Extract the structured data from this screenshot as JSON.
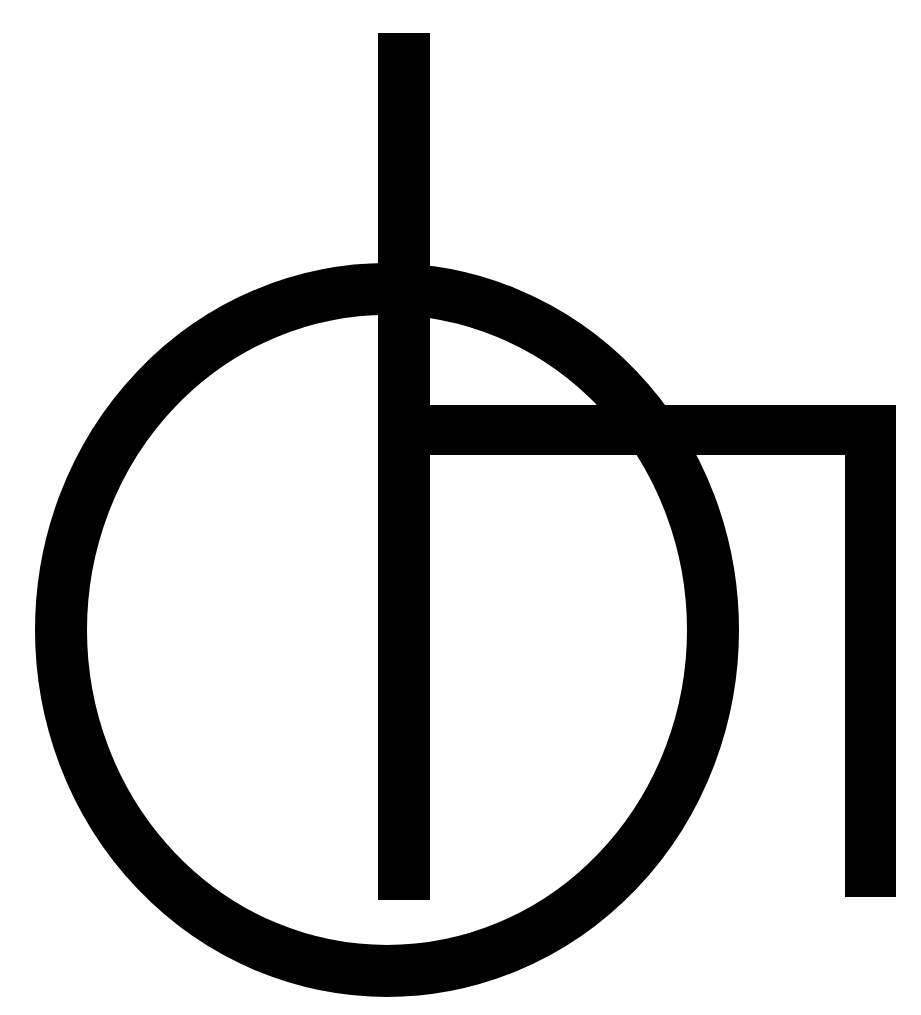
{
  "logo": {
    "name": "circle-and-bars-monogram",
    "colors": {
      "foreground": "#000000",
      "background": "#ffffff"
    }
  }
}
